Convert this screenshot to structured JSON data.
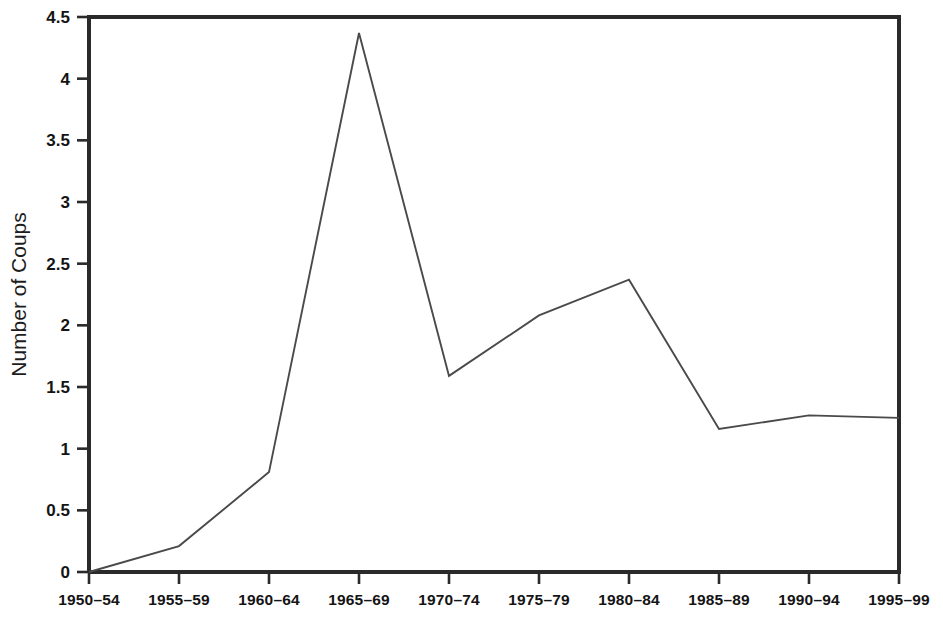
{
  "chart_data": {
    "type": "line",
    "title": "",
    "subtitle": "",
    "xlabel": "",
    "ylabel": "Number of Coups",
    "categories": [
      "1950–54",
      "1955–59",
      "1960–64",
      "1965–69",
      "1970–74",
      "1975–79",
      "1980–84",
      "1985–89",
      "1990–94",
      "1995–99"
    ],
    "values": [
      0,
      0.21,
      0.81,
      4.37,
      1.59,
      2.08,
      2.37,
      1.16,
      1.27,
      1.25
    ],
    "series": [
      {
        "name": "Number of Coups",
        "values": [
          0,
          0.21,
          0.81,
          4.37,
          1.59,
          2.08,
          2.37,
          1.16,
          1.27,
          1.25
        ]
      }
    ],
    "ylim": [
      0,
      4.5
    ],
    "yticks": [
      0,
      0.5,
      1,
      1.5,
      2,
      2.5,
      3,
      3.5,
      4,
      4.5
    ],
    "ytick_labels": [
      "0",
      "0.5",
      "1",
      "1.5",
      "2",
      "2.5",
      "3",
      "3.5",
      "4",
      "4.5"
    ],
    "grid": false,
    "legend": "none",
    "line_color": "#4a4a4a",
    "axis_color": "#2a2a2a",
    "background_color": "#ffffff"
  }
}
